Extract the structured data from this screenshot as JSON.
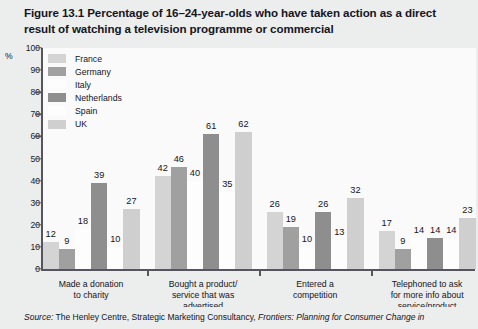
{
  "figure": {
    "title": "Figure 13.1  Percentage of 16–24-year-olds who have taken action as a direct result of watching a television programme or commercial",
    "source_prefix": "Source:",
    "source_body": " The Henley Centre, Strategic Marketing Consultancy, ",
    "source_italic": "Frontiers: Planning for Consumer Change in"
  },
  "chart_data": {
    "type": "bar",
    "title": "Figure 13.1  Percentage of 16–24-year-olds who have taken action as a direct result of watching a television programme or commercial",
    "xlabel": "",
    "ylabel": "%",
    "ylim": [
      0,
      100
    ],
    "yticks": [
      100,
      90,
      80,
      70,
      60,
      50,
      40,
      30,
      20,
      10,
      0
    ],
    "ytick_labels": [
      "100",
      "90",
      "80",
      "70",
      "60",
      "50",
      "40",
      "30",
      "20",
      "10",
      "0"
    ],
    "grid": false,
    "legend_position": "upper-left-inside",
    "categories": [
      "Made a donation to charity",
      "Bought a product/ service that was advertised",
      "Entered a competition",
      "Telephoned to ask for more info about service/product"
    ],
    "category_lines": [
      [
        "Made a donation",
        "to charity"
      ],
      [
        "Bought a product/",
        "service that was",
        "advertised"
      ],
      [
        "Entered a",
        "competition"
      ],
      [
        "Telephoned to ask",
        "for more info about",
        "service/product"
      ]
    ],
    "series": [
      {
        "name": "France",
        "color": "#d4d4d4",
        "values": [
          12,
          42,
          26,
          17
        ]
      },
      {
        "name": "Germany",
        "color": "#a0a0a0",
        "values": [
          9,
          46,
          19,
          9
        ]
      },
      {
        "name": "Italy",
        "color": "#fdfdfd",
        "values": [
          18,
          40,
          10,
          14
        ]
      },
      {
        "name": "Netherlands",
        "color": "#8e8e8e",
        "values": [
          39,
          61,
          26,
          14
        ]
      },
      {
        "name": "Spain",
        "color": "#fdfdfd",
        "values": [
          10,
          35,
          13,
          14
        ]
      },
      {
        "name": "UK",
        "color": "#cfcfcf",
        "values": [
          27,
          62,
          32,
          23
        ]
      }
    ]
  },
  "colors": {
    "page_background": "#eceded",
    "plot_background": "#fafafa",
    "axis": "#55555e",
    "text": "#14141c",
    "title": "#15151f"
  }
}
